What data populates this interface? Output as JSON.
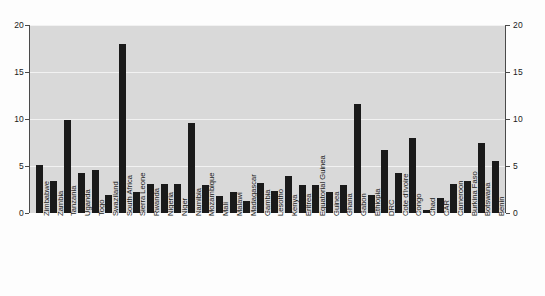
{
  "chart_data": {
    "type": "bar",
    "title": "",
    "subtitle": "",
    "xlabel": "",
    "ylabel": "",
    "ylim": [
      0,
      20
    ],
    "yticks": [
      0,
      5,
      10,
      15,
      20
    ],
    "ytick_labels": [
      "0",
      "5",
      "10",
      "15",
      "20"
    ],
    "dual_y_axis": true,
    "grid": true,
    "grid_orientation": "horizontal",
    "legend": null,
    "bar_color": "#1a1a1a",
    "plot_background": "#d9d9d9",
    "gridline_color": "#f2f2f2",
    "categories": [
      "Zimbabwe",
      "Zambia",
      "Tanzania",
      "Uganda",
      "Togo",
      "Swaziland",
      "South Africa",
      "Sierra Leone",
      "Rwanda",
      "Nigeria",
      "Niger",
      "Namibia",
      "Mozambique",
      "Mali",
      "Malawi",
      "Madagascar",
      "Gambia",
      "Lesotho",
      "Kenya",
      "Eritrea",
      "Equatorial Guinea",
      "Guinea",
      "Ghana",
      "Gabon",
      "Ethiopia",
      "DRC",
      "Cote d'Ivoire",
      "Congo",
      "Chad",
      "CAR",
      "Cameroon",
      "Burkina Faso",
      "Botswana",
      "Benin"
    ],
    "values": [
      5.1,
      3.4,
      9.9,
      4.3,
      4.6,
      1.9,
      18.0,
      2.2,
      3.1,
      3.1,
      3.1,
      9.6,
      3.0,
      1.8,
      2.2,
      1.3,
      3.2,
      2.3,
      3.9,
      3.0,
      3.0,
      2.2,
      3.0,
      11.6,
      1.9,
      6.7,
      4.3,
      8.0,
      0.3,
      1.6,
      3.1,
      3.4,
      7.4,
      5.5
    ]
  },
  "axis": {
    "left_labels": [
      "20",
      "15",
      "10",
      "5",
      "0"
    ],
    "right_labels": [
      "20",
      "15",
      "10",
      "5",
      "0"
    ]
  }
}
